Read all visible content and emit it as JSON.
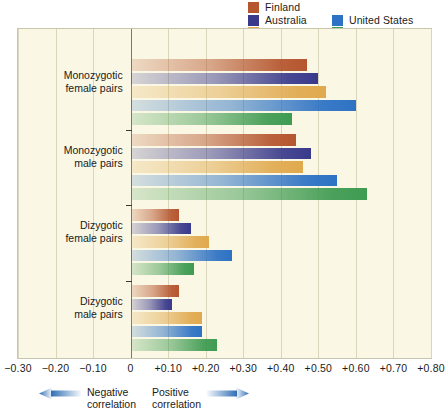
{
  "chart_data": {
    "type": "bar",
    "orientation": "horizontal",
    "title": "",
    "xlabel": "",
    "ylabel": "",
    "xlim": [
      -0.3,
      0.8
    ],
    "grid": true,
    "legend_position": "top-right",
    "categories": [
      "Monozygotic female pairs",
      "Monozygotic male pairs",
      "Dizygotic female pairs",
      "Dizygotic male pairs"
    ],
    "category_lines": [
      [
        "Monozygotic",
        "female pairs"
      ],
      [
        "Monozygotic",
        "male pairs"
      ],
      [
        "Dizygotic",
        "female pairs"
      ],
      [
        "Dizygotic",
        "male pairs"
      ]
    ],
    "series": [
      {
        "name": "Finland",
        "color": "#b5562f",
        "values": [
          0.47,
          0.44,
          0.13,
          0.13
        ]
      },
      {
        "name": "Australia",
        "color": "#3a3a8c",
        "values": [
          0.5,
          0.48,
          0.16,
          0.11
        ]
      },
      {
        "name": "Sweden",
        "color": "#e0a94e",
        "values": [
          0.52,
          0.46,
          0.21,
          0.19
        ]
      },
      {
        "name": "United States",
        "color": "#2d72c4",
        "values": [
          0.6,
          0.55,
          0.27,
          0.19
        ]
      },
      {
        "name": "Britain",
        "color": "#3f9b52",
        "values": [
          0.43,
          0.63,
          0.17,
          0.23
        ]
      }
    ],
    "xticks": [
      {
        "value": -0.3,
        "label": "−0.30"
      },
      {
        "value": -0.2,
        "label": "−0.20"
      },
      {
        "value": -0.1,
        "label": "−0.10"
      },
      {
        "value": 0.0,
        "label": "0"
      },
      {
        "value": 0.1,
        "label": "+0.10"
      },
      {
        "value": 0.2,
        "label": "+0.20"
      },
      {
        "value": 0.3,
        "label": "+0.30"
      },
      {
        "value": 0.4,
        "label": "+0.40"
      },
      {
        "value": 0.5,
        "label": "+0.50"
      },
      {
        "value": 0.6,
        "label": "+0.60"
      },
      {
        "value": 0.7,
        "label": "+0.70"
      },
      {
        "value": 0.8,
        "label": "+0.80"
      }
    ],
    "annotations": {
      "negative": {
        "line1": "Negative",
        "line2": "correlation",
        "arrow": "left"
      },
      "positive": {
        "line1": "Positive",
        "line2": "correlation",
        "arrow": "right"
      }
    }
  },
  "legend": [
    {
      "label": "Finland",
      "color": "#b5562f",
      "col": 0,
      "row": 0
    },
    {
      "label": "Australia",
      "color": "#3a3a8c",
      "col": 0,
      "row": 1
    },
    {
      "label": "Sweden",
      "color": "#e0a94e",
      "col": 0,
      "row": 2
    },
    {
      "label": "United States",
      "color": "#2d72c4",
      "col": 1,
      "row": 1
    },
    {
      "label": "Britain",
      "color": "#3f9b52",
      "col": 1,
      "row": 2
    }
  ],
  "colors": {
    "plot_background": "#faf7e4",
    "gridline": "#d9d6bb",
    "zero_line": "#7d7a63",
    "arrow": "#2f6fb5"
  }
}
